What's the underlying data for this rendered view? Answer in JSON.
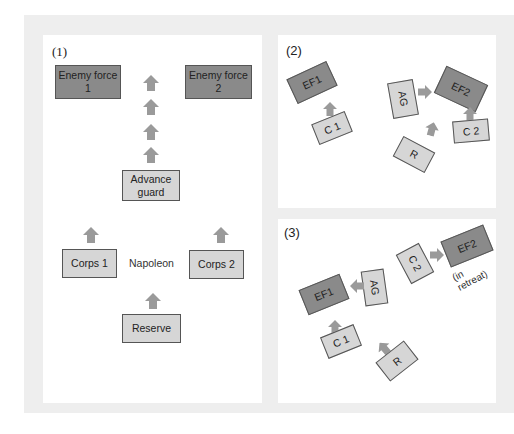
{
  "colors": {
    "enemy": "#8a8a8a",
    "friendly": "#d6d6d6",
    "arrow": "#9a9a9a",
    "frame": "#eeeeee"
  },
  "panel1": {
    "label": "(1)",
    "enemy1": {
      "line1": "Enemy force",
      "line2": "1"
    },
    "enemy2": {
      "line1": "Enemy force",
      "line2": "2"
    },
    "advance_guard": {
      "line1": "Advance",
      "line2": "guard"
    },
    "corps1": "Corps 1",
    "corps2": "Corps 2",
    "napoleon": "Napoleon",
    "reserve": "Reserve"
  },
  "panel2": {
    "label": "(2)",
    "ef1": "EF1",
    "ef2": "EF2",
    "ag": "AG",
    "c1": "C 1",
    "c2": "C 2",
    "r": "R"
  },
  "panel3": {
    "label": "(3)",
    "ef1": "EF1",
    "ef2": "EF2",
    "ag": "AG",
    "c1": "C 1",
    "c2": "C 2",
    "r": "R",
    "retreat_note": "(in retreat)"
  }
}
